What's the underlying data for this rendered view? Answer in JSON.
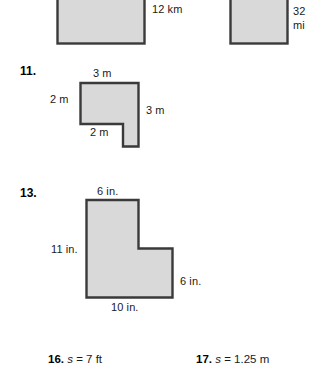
{
  "page": {
    "background": "#ffffff",
    "width": 312,
    "height": 367,
    "fill_color": "#d9d9d9",
    "stroke_color": "#3a3a3a"
  },
  "figures": {
    "top_left_square": {
      "name": "square-12-km",
      "label": "12 km",
      "shape": "rectangle"
    },
    "top_right_square": {
      "name": "square-32-mi",
      "label_line1": "32",
      "label_line2": "mi",
      "shape": "rectangle"
    },
    "problem_11": {
      "number": "11.",
      "shape": "l-shape",
      "labels": {
        "top": "3 m",
        "left": "2 m",
        "right": "3 m",
        "inner_bottom": "2 m"
      }
    },
    "problem_13": {
      "number": "13.",
      "shape": "l-shape",
      "labels": {
        "top": "6 in.",
        "left": "11 in.",
        "right": "6 in.",
        "bottom": "10 in."
      }
    }
  },
  "answers": [
    {
      "number": "16.",
      "variable": "s",
      "equals": "=",
      "value": "7 ft"
    },
    {
      "number": "17.",
      "variable": "s",
      "equals": "=",
      "value": "1.25 m"
    }
  ]
}
